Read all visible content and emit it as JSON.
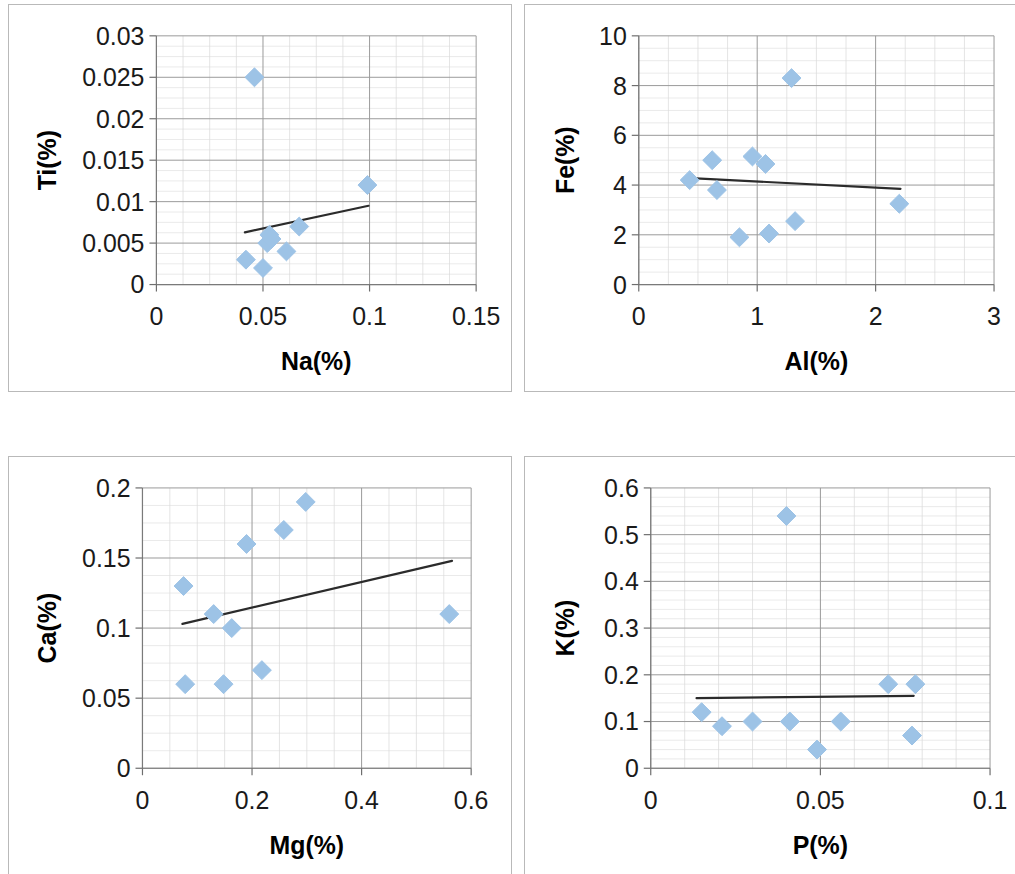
{
  "figure": {
    "title": "",
    "panel_count": 4,
    "marker_color": "#9dc3e6",
    "trendline_color": "#2b2b2b",
    "grid_major_color": "#9a9a9a",
    "grid_minor_color": "#d8d8d8"
  },
  "chart_data": [
    {
      "type": "scatter",
      "id": "ti-vs-na",
      "title": "",
      "xlabel": "Na(%)",
      "ylabel": "Ti(%)",
      "xlim": [
        0,
        0.15
      ],
      "ylim": [
        0,
        0.03
      ],
      "xticks": [
        0,
        0.05,
        0.1,
        0.15
      ],
      "xticklabels": [
        "0",
        "0.05",
        "0.1",
        "0.15"
      ],
      "yticks": [
        0,
        0.005,
        0.01,
        0.015,
        0.02,
        0.025,
        0.03
      ],
      "yticklabels": [
        "0",
        "0.005",
        "0.01",
        "0.015",
        "0.02",
        "0.025",
        "0.03"
      ],
      "grid": true,
      "minor_grid": true,
      "legend": false,
      "x": [
        0.042,
        0.046,
        0.05,
        0.052,
        0.053,
        0.054,
        0.061,
        0.067,
        0.099
      ],
      "y": [
        0.003,
        0.025,
        0.002,
        0.005,
        0.006,
        0.0055,
        0.004,
        0.007,
        0.012
      ],
      "trendline": {
        "x0": 0.0415,
        "y0": 0.0063,
        "x1": 0.0995,
        "y1": 0.0095
      }
    },
    {
      "type": "scatter",
      "id": "fe-vs-al",
      "title": "",
      "xlabel": "Al(%)",
      "ylabel": "Fe(%)",
      "xlim": [
        0,
        3
      ],
      "ylim": [
        0,
        10
      ],
      "xticks": [
        0,
        1,
        2,
        3
      ],
      "xticklabels": [
        "0",
        "1",
        "2",
        "3"
      ],
      "yticks": [
        0,
        2,
        4,
        6,
        8,
        10
      ],
      "yticklabels": [
        "0",
        "2",
        "4",
        "6",
        "8",
        "10"
      ],
      "grid": true,
      "minor_grid": true,
      "legend": false,
      "x": [
        0.43,
        0.62,
        0.66,
        0.85,
        0.96,
        1.07,
        1.1,
        1.29,
        1.32,
        2.2
      ],
      "y": [
        4.2,
        5.0,
        3.8,
        1.9,
        5.15,
        4.85,
        2.05,
        8.3,
        2.55,
        3.25
      ],
      "trendline": {
        "x0": 0.44,
        "y0": 4.28,
        "x1": 2.21,
        "y1": 3.85
      }
    },
    {
      "type": "scatter",
      "id": "ca-vs-mg",
      "title": "",
      "xlabel": "Mg(%)",
      "ylabel": "Ca(%)",
      "xlim": [
        0,
        0.6
      ],
      "ylim": [
        0,
        0.2
      ],
      "xticks": [
        0,
        0.2,
        0.4,
        0.6
      ],
      "xticklabels": [
        "0",
        "0.2",
        "0.4",
        "0.6"
      ],
      "yticks": [
        0,
        0.05,
        0.1,
        0.15,
        0.2
      ],
      "yticklabels": [
        "0",
        "0.05",
        "0.1",
        "0.15",
        "0.2"
      ],
      "grid": true,
      "minor_grid": true,
      "legend": false,
      "x": [
        0.075,
        0.078,
        0.13,
        0.148,
        0.163,
        0.19,
        0.218,
        0.258,
        0.298,
        0.56
      ],
      "y": [
        0.13,
        0.06,
        0.11,
        0.06,
        0.1,
        0.16,
        0.07,
        0.17,
        0.19,
        0.11
      ],
      "trendline": {
        "x0": 0.073,
        "y0": 0.103,
        "x1": 0.565,
        "y1": 0.148
      }
    },
    {
      "type": "scatter",
      "id": "k-vs-p",
      "title": "",
      "xlabel": "P(%)",
      "ylabel": "K(%)",
      "xlim": [
        0,
        0.1
      ],
      "ylim": [
        0,
        0.6
      ],
      "xticks": [
        0,
        0.05,
        0.1
      ],
      "xticklabels": [
        "0",
        "0.05",
        "0.1"
      ],
      "yticks": [
        0,
        0.1,
        0.2,
        0.3,
        0.4,
        0.5,
        0.6
      ],
      "yticklabels": [
        "0",
        "0.1",
        "0.2",
        "0.3",
        "0.4",
        "0.5",
        "0.6"
      ],
      "grid": true,
      "minor_grid": true,
      "legend": false,
      "x": [
        0.015,
        0.021,
        0.03,
        0.04,
        0.041,
        0.049,
        0.056,
        0.07,
        0.077,
        0.078
      ],
      "y": [
        0.12,
        0.09,
        0.1,
        0.54,
        0.1,
        0.04,
        0.1,
        0.18,
        0.07,
        0.18
      ],
      "trendline": {
        "x0": 0.0135,
        "y0": 0.15,
        "x1": 0.0775,
        "y1": 0.155
      }
    }
  ]
}
